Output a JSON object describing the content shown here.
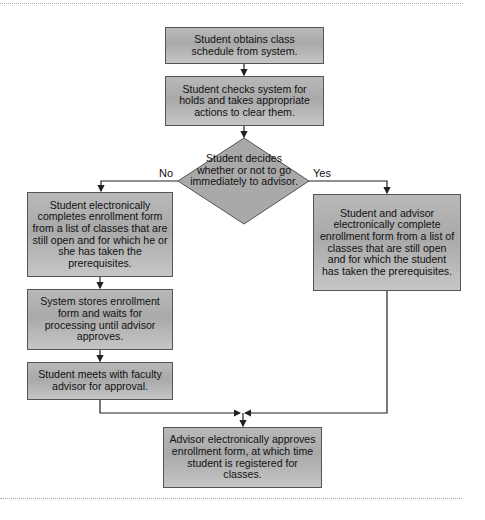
{
  "diagram": {
    "type": "flowchart",
    "steps": {
      "obtain_schedule": "Student obtains class schedule from system.",
      "check_holds": "Student checks system for holds and takes appropriate actions to clear them.",
      "decision": "Student decides whether or not to go immediately to advisor.",
      "no_branch_enroll": "Student electronically completes enrollment form from a list of classes that are still open and for which he or she has taken the prerequisites.",
      "system_stores": "System stores enrollment form and waits for processing until advisor approves.",
      "meet_advisor": "Student meets with faculty advisor for approval.",
      "yes_branch_enroll": "Student and advisor electronically complete enrollment form from a list of classes that are still open and for which the student has taken the prerequisites.",
      "advisor_approves": "Advisor electronically approves enrollment form, at which time student is registered for classes."
    },
    "branch_labels": {
      "no": "No",
      "yes": "Yes"
    },
    "colors": {
      "box_fill": "#b3b3b3",
      "box_border": "#555555",
      "connector": "#222222",
      "dotted_rule": "#a8a8a8"
    }
  }
}
